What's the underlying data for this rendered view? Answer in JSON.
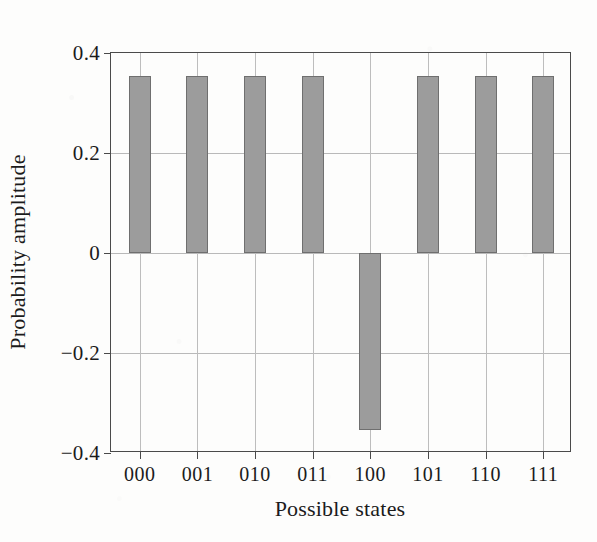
{
  "chart_data": {
    "type": "bar",
    "title": "",
    "xlabel": "Possible states",
    "ylabel": "Probability amplitude",
    "categories": [
      "000",
      "001",
      "010",
      "011",
      "100",
      "101",
      "110",
      "111"
    ],
    "values": [
      0.354,
      0.354,
      0.354,
      0.354,
      -0.354,
      0.354,
      0.354,
      0.354
    ],
    "ylim": [
      -0.4,
      0.4
    ],
    "ytick_labels": [
      "0.4",
      "0.2",
      "0",
      "−0.2",
      "−0.4"
    ],
    "ytick_values": [
      0.4,
      0.2,
      0,
      -0.2,
      -0.4
    ],
    "grid": true,
    "grid_axis": "both",
    "legend": "none",
    "series": [
      {
        "name": "Probability amplitude",
        "values": [
          0.354,
          0.354,
          0.354,
          0.354,
          -0.354,
          0.354,
          0.354,
          0.354
        ]
      }
    ],
    "colors": {
      "bar_fill": "#9c9c9c",
      "bar_border": "#6f6f6f",
      "axis": "#4a4a4a",
      "grid": "#bdbdbd",
      "background": "#fdfdfc",
      "text": "#1b1b1b"
    }
  }
}
